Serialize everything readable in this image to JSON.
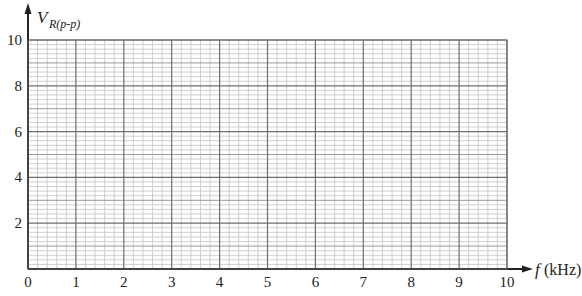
{
  "chart_data": {
    "type": "line",
    "title": "",
    "xlabel": "f (kHz)",
    "xlabel_var": "f",
    "xlabel_unit": "(kHz)",
    "ylabel": "V_R(p-p)",
    "ylabel_var": "V",
    "ylabel_sub": "R(p-p)",
    "xlim": [
      0,
      10
    ],
    "ylim": [
      0,
      10
    ],
    "x_ticks": [
      "0",
      "1",
      "2",
      "3",
      "4",
      "5",
      "6",
      "7",
      "8",
      "9",
      "10"
    ],
    "y_ticks": [
      "2",
      "4",
      "6",
      "8",
      "10"
    ],
    "x_minor_step": 0.2,
    "y_minor_step": 0.2,
    "grid": true,
    "series": [],
    "note": "Blank graph paper grid for plotting; no data plotted"
  },
  "colors": {
    "axis": "#222222",
    "major_grid": "#6e6e6e",
    "mid_grid": "#9a9a9a",
    "minor_grid": "#c4c4c4"
  }
}
